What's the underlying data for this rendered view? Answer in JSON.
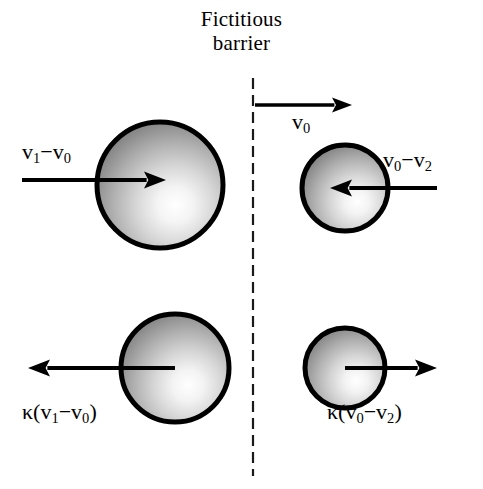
{
  "figure": {
    "title": {
      "line1": "Fictitious",
      "line2": "barrier"
    },
    "background_color": "#ffffff",
    "ink_color": "#000000",
    "barrier": {
      "name": "fictitious-barrier",
      "style": "dashed-vertical-line",
      "x": 253,
      "y_start": 78,
      "y_end": 476,
      "dash_length": 11,
      "gap_length": 6,
      "width": 2.2
    },
    "labels": {
      "incoming_left": "v₁−v₀",
      "barrier_velocity": "v₀",
      "incoming_right": "v₀−v₂",
      "outgoing_left": "κ(v₁−v₀)",
      "outgoing_right": "κ(v₀−v₂)"
    },
    "label_parts": {
      "incoming_left": {
        "v": "v",
        "sub1": "1",
        "op": "−",
        "v2": "v",
        "sub2": "0"
      },
      "barrier_velocity": {
        "v": "v",
        "sub": "0"
      },
      "incoming_right": {
        "v": "v",
        "sub1": "0",
        "op": "−",
        "v2": "v",
        "sub2": "2"
      },
      "outgoing_left": {
        "kappa": "κ",
        "open": "(",
        "v": "v",
        "sub1": "1",
        "op": "−",
        "v2": "v",
        "sub2": "0",
        "close": ")"
      },
      "outgoing_right": {
        "kappa": "κ",
        "open": "(",
        "v": "v",
        "sub1": "0",
        "op": "−",
        "v2": "v",
        "sub2": "2",
        "close": ")"
      }
    },
    "spheres": [
      {
        "name": "sphere-top-left-large",
        "cx": 160,
        "cy": 185,
        "r": 63,
        "stroke_width": 5,
        "highlight_cx": 184,
        "highlight_cy": 205,
        "highlight_r": 78
      },
      {
        "name": "sphere-top-right-small",
        "cx": 345,
        "cy": 188,
        "r": 43,
        "stroke_width": 5,
        "highlight_cx": 362,
        "highlight_cy": 202,
        "highlight_r": 54
      },
      {
        "name": "sphere-bottom-left-large",
        "cx": 175,
        "cy": 368,
        "r": 54,
        "stroke_width": 5,
        "highlight_cx": 196,
        "highlight_cy": 385,
        "highlight_r": 68
      },
      {
        "name": "sphere-bottom-right-small",
        "cx": 345,
        "cy": 368,
        "r": 40,
        "stroke_width": 5,
        "highlight_cx": 361,
        "highlight_cy": 381,
        "highlight_r": 50
      }
    ],
    "arrows": [
      {
        "name": "arrow-barrier-v0",
        "x1": 255,
        "y1": 105,
        "x2": 352,
        "y2": 105,
        "direction": "right",
        "shaft_width": 3.6,
        "head_length": 20,
        "head_width": 15
      },
      {
        "name": "arrow-incoming-left",
        "x1": 22,
        "y1": 180,
        "x2": 166,
        "y2": 180,
        "direction": "right",
        "shaft_width": 4.2,
        "head_length": 22,
        "head_width": 17
      },
      {
        "name": "arrow-incoming-right",
        "x1": 437,
        "y1": 188,
        "x2": 330,
        "y2": 188,
        "direction": "left",
        "shaft_width": 4.2,
        "head_length": 22,
        "head_width": 17
      },
      {
        "name": "arrow-outgoing-left",
        "x1": 175,
        "y1": 368,
        "x2": 28,
        "y2": 368,
        "direction": "left",
        "shaft_width": 4.2,
        "head_length": 22,
        "head_width": 17
      },
      {
        "name": "arrow-outgoing-right",
        "x1": 345,
        "y1": 368,
        "x2": 437,
        "y2": 368,
        "direction": "right",
        "shaft_width": 4.2,
        "head_length": 22,
        "head_width": 17
      }
    ]
  }
}
